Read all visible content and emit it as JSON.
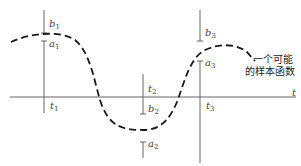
{
  "diagram": {
    "title": "",
    "axis": {
      "label": "t"
    },
    "times": [
      {
        "name": "t",
        "sub": "1"
      },
      {
        "name": "t",
        "sub": "2"
      },
      {
        "name": "t",
        "sub": "3"
      }
    ],
    "upper_bounds": [
      {
        "name": "b",
        "sub": "1"
      },
      {
        "name": "b",
        "sub": "2"
      },
      {
        "name": "b",
        "sub": "3"
      }
    ],
    "lower_bounds": [
      {
        "name": "a",
        "sub": "1"
      },
      {
        "name": "a",
        "sub": "2"
      },
      {
        "name": "a",
        "sub": "3"
      }
    ],
    "curve_annotation": {
      "line1": "一个可能",
      "line2": "的样本函数"
    },
    "colors": {
      "axis": "#555555",
      "curve": "#1a1a1a",
      "text": "#444444"
    }
  }
}
